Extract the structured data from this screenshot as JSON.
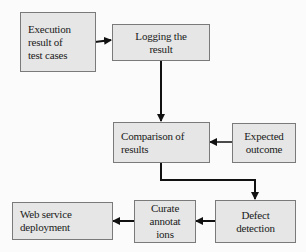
{
  "diagram": {
    "type": "flowchart",
    "colors": {
      "box_fill": "#e6e6e6",
      "box_border": "#7a7a7a",
      "arrow": "#111111",
      "background": "#fbfbfb"
    },
    "nodes": {
      "execution": {
        "lines": [
          "Execution",
          "result of",
          "test cases"
        ]
      },
      "logging": {
        "lines": [
          "Logging the",
          "result"
        ]
      },
      "comparison": {
        "lines": [
          "Comparison of",
          "results"
        ]
      },
      "expected": {
        "lines": [
          "Expected",
          "outcome"
        ]
      },
      "defect": {
        "lines": [
          "Defect",
          "detection"
        ]
      },
      "curate": {
        "lines": [
          "Curate",
          "annotat",
          "ions"
        ]
      },
      "deployment": {
        "lines": [
          "Web service",
          "deployment"
        ]
      }
    },
    "edges": [
      {
        "from": "execution",
        "to": "logging"
      },
      {
        "from": "logging",
        "to": "comparison"
      },
      {
        "from": "expected",
        "to": "comparison"
      },
      {
        "from": "comparison",
        "to": "defect"
      },
      {
        "from": "defect",
        "to": "curate"
      },
      {
        "from": "curate",
        "to": "deployment"
      }
    ]
  }
}
